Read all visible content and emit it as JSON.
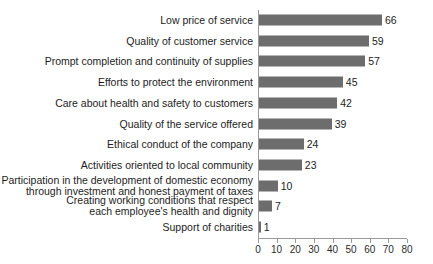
{
  "chart_data": {
    "type": "bar",
    "orientation": "horizontal",
    "title": "",
    "subtitle": "",
    "xlabel": "",
    "ylabel": "",
    "xlim": [
      0,
      80
    ],
    "xticks": [
      0,
      10,
      20,
      30,
      40,
      50,
      60,
      70,
      80
    ],
    "xtick_labels": [
      "0",
      "10",
      "20",
      "30",
      "40",
      "50",
      "60",
      "70",
      "80"
    ],
    "grid": false,
    "legend": null,
    "bar_color": "#6d6d6d",
    "background_color": "#ffffff",
    "axis_color": "#9a9a9a",
    "text_color": "#1d1d1d",
    "categories": [
      "Low price of service",
      "Quality of customer service",
      "Prompt completion and continuity of supplies",
      "Efforts to protect the environment",
      "Care about health and safety to customers",
      "Quality of the service offered",
      "Ethical conduct of the company",
      "Activities oriented to local community",
      "Participation in the development of domestic economy\nthrough investment and honest payment of taxes",
      "Creating working conditions that respect\neach employee's health and dignity",
      "Support of charities"
    ],
    "values": [
      66,
      59,
      57,
      45,
      42,
      39,
      24,
      23,
      10,
      7,
      1
    ],
    "value_labels": [
      "66",
      "59",
      "57",
      "45",
      "42",
      "39",
      "24",
      "23",
      "10",
      "7",
      "1"
    ]
  }
}
